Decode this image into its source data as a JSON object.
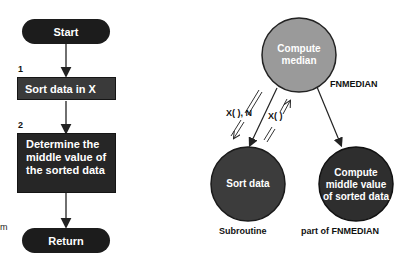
{
  "flowchart": {
    "start_label": "Start",
    "steps": [
      {
        "number": "1",
        "label": "Sort data in X"
      },
      {
        "number": "2",
        "label": "Determine the middle value of the sorted data"
      }
    ],
    "end_label": "Return"
  },
  "structure_chart": {
    "top_module": {
      "label": "Compute median",
      "caption": "FNMEDIAN"
    },
    "left_module": {
      "label": "Sort data",
      "caption": "Subroutine"
    },
    "right_module": {
      "label": "Compute middle value of sorted data",
      "caption": "part of FNMEDIAN"
    },
    "data_flows": [
      {
        "label": "X( ), N",
        "direction": "down-to-left-module"
      },
      {
        "label": "X( )",
        "direction": "up-from-left-module"
      }
    ]
  },
  "edge_fragment": "m",
  "colors": {
    "terminal_fill": "#1c1c1c",
    "process_fill": "#3a3a3a",
    "top_circle_fill": "#9a9a9a",
    "bottom_circle_fill": "#3c3c3c",
    "line": "#222222"
  }
}
